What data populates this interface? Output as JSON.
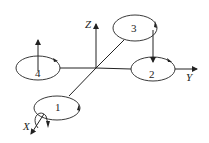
{
  "diagram": {
    "axes": {
      "x_label": "X",
      "y_label": "Y",
      "z_label": "Z"
    },
    "rotors": [
      {
        "id": "1",
        "label": "1"
      },
      {
        "id": "2",
        "label": "2"
      },
      {
        "id": "3",
        "label": "3"
      },
      {
        "id": "4",
        "label": "4"
      }
    ],
    "colors": {
      "stroke": "#222222",
      "background": "#ffffff"
    }
  }
}
